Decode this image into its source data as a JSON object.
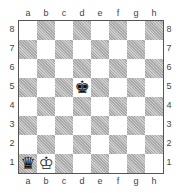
{
  "files": [
    "a",
    "b",
    "c",
    "d",
    "e",
    "f",
    "g",
    "h"
  ],
  "ranks": [
    "8",
    "7",
    "6",
    "5",
    "4",
    "3",
    "2",
    "1"
  ],
  "pieces": [
    {
      "square": "d5",
      "type": "king",
      "color": "black",
      "glyph": "♚"
    },
    {
      "square": "a1",
      "type": "queen",
      "color": "black",
      "glyph": "♛"
    },
    {
      "square": "b1",
      "type": "king",
      "color": "white",
      "glyph": "♔"
    }
  ]
}
